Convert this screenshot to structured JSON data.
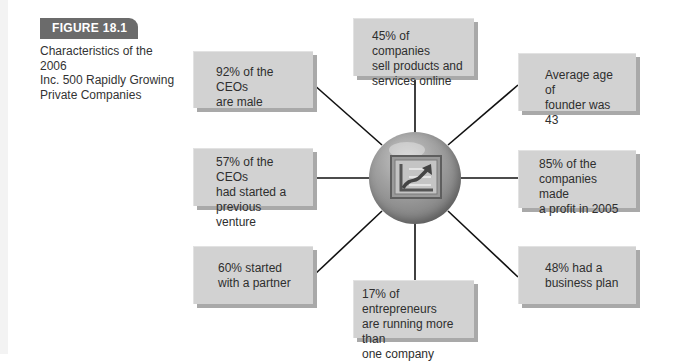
{
  "figure": {
    "label": "FIGURE 18.1",
    "caption_lines": [
      "Characteristics of the 2006",
      "Inc. 500 Rapidly Growing",
      "Private Companies"
    ]
  },
  "hub": {
    "icon": "rising-chart-icon"
  },
  "facts": [
    {
      "position": "top",
      "lines": [
        "45% of companies",
        "sell products and",
        "services online"
      ]
    },
    {
      "position": "top-right",
      "lines": [
        "Average age of",
        "founder was 43"
      ]
    },
    {
      "position": "right",
      "lines": [
        "85% of the",
        "companies made",
        "a profit in 2005"
      ]
    },
    {
      "position": "bottom-right",
      "lines": [
        "48% had a",
        "business plan"
      ]
    },
    {
      "position": "bottom",
      "lines": [
        "17% of entrepreneurs",
        "are running more than",
        "one company"
      ]
    },
    {
      "position": "bottom-left",
      "lines": [
        "60% started",
        "with a partner"
      ]
    },
    {
      "position": "left",
      "lines": [
        "57% of the CEOs",
        "had started a",
        "previous venture"
      ]
    },
    {
      "position": "top-left",
      "lines": [
        "92% of the CEOs",
        "are male"
      ]
    }
  ],
  "colors": {
    "tab": "#6b6b6b",
    "box_fill": "#d2d2d2",
    "box_shadow": "#a9a9a9",
    "connector": "#111111",
    "hub": "#8c8c8c"
  }
}
